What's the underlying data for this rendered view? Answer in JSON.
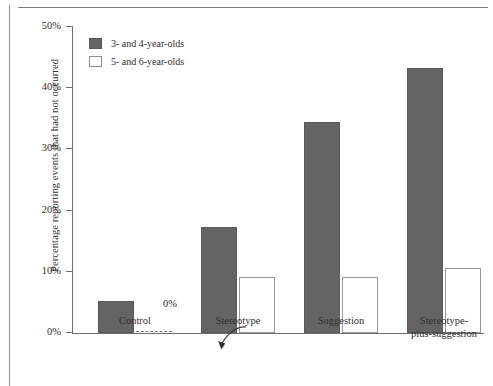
{
  "chart_data": {
    "type": "bar",
    "title": "",
    "xlabel": "",
    "ylabel": "Percentage reporting events that had not occurred",
    "ylim": [
      0,
      50
    ],
    "ytick_labels": [
      "0%",
      "10%",
      "20%",
      "30%",
      "40%",
      "50%"
    ],
    "ytick_values": [
      0,
      10,
      20,
      30,
      40,
      50
    ],
    "grid": false,
    "legend_position": "top-left",
    "categories": [
      "Control",
      "Stereotype",
      "Suggestion",
      "Stereotype-\nplus-suggestion"
    ],
    "category_lines": [
      [
        "Control"
      ],
      [
        "Stereotype"
      ],
      [
        "Suggestion"
      ],
      [
        "Stereotype-",
        "plus-suggestion"
      ]
    ],
    "series": [
      {
        "name": "3- and 4-year-olds",
        "color": "#666463",
        "values": [
          5.2,
          17.4,
          34.4,
          43.3
        ]
      },
      {
        "name": "5- and 6-year-olds",
        "color": "#ffffff",
        "values": [
          0,
          9.2,
          9.2,
          10.7
        ]
      }
    ],
    "annotations": [
      {
        "text": "0%",
        "series": "5- and 6-year-olds",
        "category": "Control",
        "value": 0,
        "style": "curved-arrow-to-dashed-zero-bar"
      }
    ]
  },
  "legend": {
    "items": [
      {
        "label": "3- and 4-year-olds",
        "swatch": "dark"
      },
      {
        "label": "5- and 6-year-olds",
        "swatch": "light"
      }
    ]
  },
  "axis": {
    "y_title": "Percentage reporting events that had not occurred"
  }
}
